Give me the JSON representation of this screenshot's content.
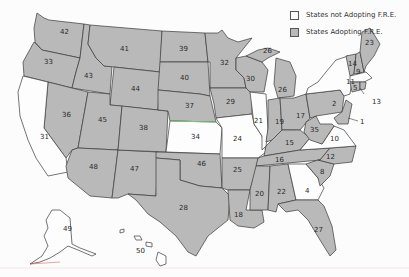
{
  "legend": {
    "not_adopting": "States not Adopting F.R.E.",
    "adopting": "States Adopting F.R.E.",
    "colors": {
      "adopting": "#b9b9b9",
      "not_adopting": "#fdfdfd",
      "border": "#3a3a3a"
    }
  },
  "states": [
    {
      "label": "42",
      "adopting": true
    },
    {
      "label": "33",
      "adopting": true
    },
    {
      "label": "43",
      "adopting": true
    },
    {
      "label": "41",
      "adopting": true
    },
    {
      "label": "44",
      "adopting": true
    },
    {
      "label": "36",
      "adopting": true
    },
    {
      "label": "45",
      "adopting": true
    },
    {
      "label": "31",
      "adopting": false
    },
    {
      "label": "48",
      "adopting": true
    },
    {
      "label": "47",
      "adopting": true
    },
    {
      "label": "38",
      "adopting": true
    },
    {
      "label": "39",
      "adopting": true
    },
    {
      "label": "40",
      "adopting": true
    },
    {
      "label": "37",
      "adopting": true
    },
    {
      "label": "34",
      "adopting": false
    },
    {
      "label": "46",
      "adopting": true
    },
    {
      "label": "28",
      "adopting": true
    },
    {
      "label": "32",
      "adopting": true
    },
    {
      "label": "29",
      "adopting": true
    },
    {
      "label": "24",
      "adopting": false
    },
    {
      "label": "25",
      "adopting": true
    },
    {
      "label": "18",
      "adopting": true
    },
    {
      "label": "30",
      "adopting": true
    },
    {
      "label": "21",
      "adopting": false
    },
    {
      "label": "26",
      "adopting": true
    },
    {
      "label": "19",
      "adopting": true
    },
    {
      "label": "17",
      "adopting": true
    },
    {
      "label": "16",
      "adopting": true
    },
    {
      "label": "15",
      "adopting": true
    },
    {
      "label": "20",
      "adopting": true
    },
    {
      "label": "22",
      "adopting": true
    },
    {
      "label": "4",
      "adopting": false
    },
    {
      "label": "27",
      "adopting": true
    },
    {
      "label": "8",
      "adopting": true
    },
    {
      "label": "12",
      "adopting": true
    },
    {
      "label": "10",
      "adopting": false
    },
    {
      "label": "35",
      "adopting": true
    },
    {
      "label": "2",
      "adopting": true
    },
    {
      "label": "11",
      "adopting": false
    },
    {
      "label": "14",
      "adopting": true
    },
    {
      "label": "9",
      "adopting": true
    },
    {
      "label": "23",
      "adopting": true
    },
    {
      "label": "5",
      "adopting": true
    },
    {
      "label": "13",
      "adopting": true
    },
    {
      "label": "1",
      "adopting": true
    },
    {
      "label": "49",
      "adopting": false
    },
    {
      "label": "50",
      "adopting": false
    }
  ]
}
